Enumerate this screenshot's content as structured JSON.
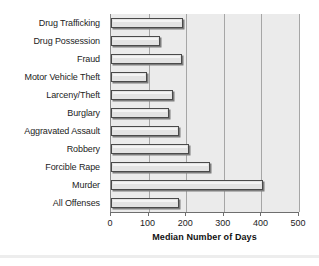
{
  "chart_data": {
    "type": "bar",
    "orientation": "horizontal",
    "title": "",
    "xlabel": "Median Number of Days",
    "ylabel": "",
    "xlim": [
      0,
      500
    ],
    "xticks": [
      0,
      100,
      200,
      300,
      400,
      500
    ],
    "xtick_labels": [
      "0",
      "100",
      "200",
      "300",
      "400",
      "500"
    ],
    "grid": true,
    "grid_axis": "x",
    "legend": false,
    "categories": [
      "Drug Trafficking",
      "Drug Possession",
      "Fraud",
      "Motor Vehicle Theft",
      "Larceny/Theft",
      "Burglary",
      "Aggravated Assault",
      "Robbery",
      "Forcible Rape",
      "Murder",
      "All Offenses"
    ],
    "values": [
      192,
      131,
      190,
      97,
      165,
      155,
      182,
      208,
      262,
      405,
      180
    ],
    "colors": {
      "plot_background": "#ebebeb",
      "bar_fill": "#e3e3e3",
      "bar_outline": "#4a4a4a",
      "bar_shadow": "#7d7d7d",
      "gridline": "#a6a6a6",
      "axis": "#6e6e6e",
      "text": "#1c1c1c"
    }
  }
}
